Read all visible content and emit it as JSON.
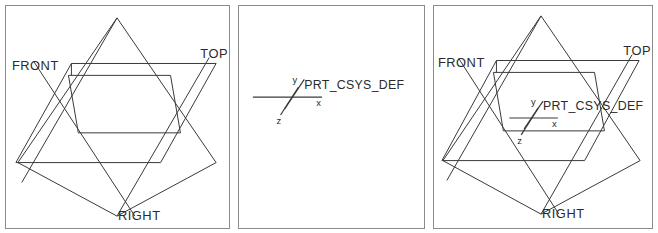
{
  "figure": {
    "background_color": "#ffffff",
    "line_color": "#3a3a3a",
    "border_color": "#8b8b8b",
    "panel_count": 3
  },
  "labels": {
    "front": "FRONT",
    "top": "TOP",
    "right": "RIGHT",
    "csys": "PRT_CSYS_DEF",
    "axis_x": "x",
    "axis_y": "y",
    "axis_z": "z"
  },
  "panels": [
    {
      "id": "panel-1",
      "name": "datum-planes-panel",
      "shows_datum_planes": true,
      "shows_csys": false,
      "plane_labels": [
        "FRONT",
        "TOP",
        "RIGHT"
      ]
    },
    {
      "id": "panel-2",
      "name": "coordinate-system-panel",
      "shows_datum_planes": false,
      "shows_csys": true,
      "csys_label": "PRT_CSYS_DEF",
      "axes": [
        "x",
        "y",
        "z"
      ]
    },
    {
      "id": "panel-3",
      "name": "combined-panel",
      "shows_datum_planes": true,
      "shows_csys": true,
      "plane_labels": [
        "FRONT",
        "TOP",
        "RIGHT"
      ],
      "csys_label": "PRT_CSYS_DEF",
      "axes": [
        "x",
        "y",
        "z"
      ]
    }
  ]
}
